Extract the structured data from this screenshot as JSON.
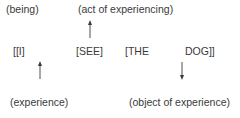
{
  "diagram": {
    "top_labels": {
      "being": "(being)",
      "act": "(act of experiencing)"
    },
    "sentence": {
      "subject": "[[I]",
      "verb": "[SEE]",
      "det": "[THE",
      "noun": "DOG]]"
    },
    "bottom_labels": {
      "experience": "(experience)",
      "object": "(object of experience)"
    },
    "arrows": [
      {
        "from": "verb",
        "to": "act",
        "direction": "up"
      },
      {
        "from": "experience",
        "to": "subject",
        "direction": "up"
      },
      {
        "from": "noun",
        "to": "object",
        "direction": "down"
      }
    ],
    "colors": {
      "text": "#3a3a3a",
      "arrow": "#3a3a3a",
      "background": "#ffffff"
    }
  }
}
